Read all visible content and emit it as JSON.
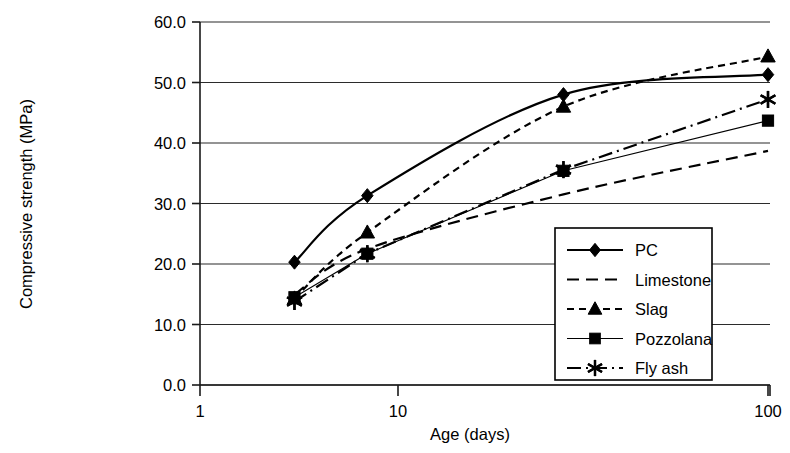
{
  "chart_data": {
    "type": "line",
    "title": "",
    "xlabel": "Age (days)",
    "ylabel": "Compressive strength (MPa)",
    "xscale": "log",
    "xlim": [
      1,
      100
    ],
    "ylim": [
      0,
      60
    ],
    "xticks": [
      "1",
      "10",
      "100"
    ],
    "xtick_values": [
      1,
      10,
      100
    ],
    "yticks": [
      "0.0",
      "10.0",
      "20.0",
      "30.0",
      "40.0",
      "50.0",
      "60.0"
    ],
    "ytick_values": [
      0,
      10,
      20,
      30,
      40,
      50,
      60
    ],
    "grid": "horizontal",
    "legend_position": "lower-right-inside",
    "x": [
      3,
      7,
      28,
      100
    ],
    "series": [
      {
        "name": "PC",
        "values": [
          20.3,
          31.3,
          48.0,
          51.3
        ],
        "marker": "diamond",
        "linestyle": "solid",
        "color": "#000000"
      },
      {
        "name": "Limestone",
        "values": [
          15.0,
          22.5,
          31.5,
          38.7
        ],
        "marker": "none",
        "linestyle": "dashed",
        "color": "#000000"
      },
      {
        "name": "Slag",
        "values": [
          14.3,
          25.2,
          46.0,
          54.3
        ],
        "marker": "triangle",
        "linestyle": "dotted-dash",
        "color": "#000000"
      },
      {
        "name": "Pozzolana",
        "values": [
          14.5,
          21.7,
          35.4,
          43.7
        ],
        "marker": "square",
        "linestyle": "solid-thin",
        "color": "#000000"
      },
      {
        "name": "Fly ash",
        "values": [
          13.8,
          21.7,
          35.6,
          47.2
        ],
        "marker": "asterisk",
        "linestyle": "dash-dot",
        "color": "#000000"
      }
    ]
  },
  "axes": {
    "y_title": "Compressive strength (MPa)",
    "x_title": "Age (days)",
    "ytick_labels": [
      "60.0",
      "50.0",
      "40.0",
      "30.0",
      "20.0",
      "10.0",
      "0.0"
    ],
    "xtick_labels": [
      "1",
      "10",
      "100"
    ]
  },
  "legend": {
    "items": [
      {
        "label": "PC"
      },
      {
        "label": "Limestone"
      },
      {
        "label": "Slag"
      },
      {
        "label": "Pozzolana"
      },
      {
        "label": "Fly ash"
      }
    ]
  }
}
